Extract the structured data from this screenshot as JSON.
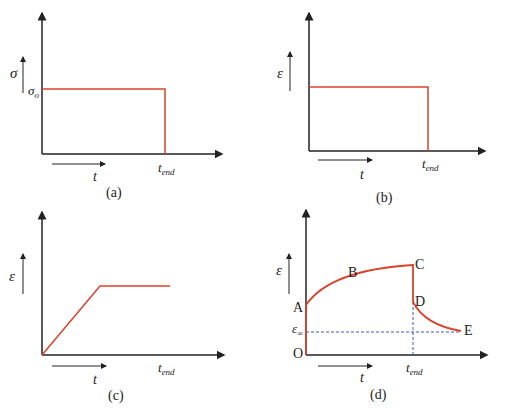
{
  "panels": {
    "a": {
      "caption": "(a)",
      "y_label": "σ",
      "level_label": "σ",
      "level_sub": "o",
      "x_arrow_label": "t",
      "tick_label": "t",
      "tick_sub": "end"
    },
    "b": {
      "caption": "(b)",
      "y_label": "ε",
      "x_arrow_label": "t",
      "tick_label": "t",
      "tick_sub": "end"
    },
    "c": {
      "caption": "(c)",
      "y_label": "ε",
      "x_arrow_label": "t",
      "tick_label": "t",
      "tick_sub": "end"
    },
    "d": {
      "caption": "(d)",
      "y_label": "ε",
      "x_arrow_label": "t",
      "tick_label": "t",
      "tick_sub": "end",
      "points": {
        "O": "O",
        "A": "A",
        "B": "B",
        "C": "C",
        "D": "D",
        "E": "E"
      },
      "eps_inf_label": "ε",
      "eps_inf_sub": "∞"
    }
  },
  "colors": {
    "curve": "#d9432b",
    "axis": "#222222",
    "dashed": "#3a5fb0"
  }
}
